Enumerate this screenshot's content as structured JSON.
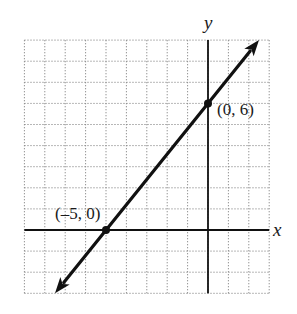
{
  "chart_data": {
    "type": "line",
    "title": "",
    "xlabel": "x",
    "ylabel": "y",
    "xlim": [
      -9,
      3
    ],
    "ylim": [
      -3,
      9
    ],
    "grid": true,
    "grid_style": "dotted",
    "grid_step": 1,
    "tick_labels": false,
    "legend": null,
    "series": [
      {
        "name": "line",
        "equation": "y = (6/5)x + 6",
        "slope": 1.2,
        "intercept": 6,
        "arrows": "both ends",
        "x": [
          -7.5,
          2.5
        ],
        "y": [
          -3,
          9
        ]
      }
    ],
    "points": [
      {
        "x": -5,
        "y": 0,
        "label": "(–5, 0)"
      },
      {
        "x": 0,
        "y": 6,
        "label": "(0, 6)"
      }
    ],
    "colors": {
      "line": "#111111",
      "grid": "#888888",
      "axis": "#111111"
    }
  },
  "labels": {
    "x_axis": "x",
    "y_axis": "y",
    "point_a": "(–5, 0)",
    "point_b": "(0, 6)"
  }
}
